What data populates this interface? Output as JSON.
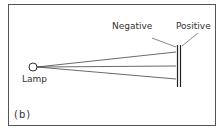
{
  "figure": {
    "panel_label": "(b)",
    "labels": {
      "lamp": "Lamp",
      "negative": "Negative",
      "positive": "Positive"
    },
    "colors": {
      "line": "#333333",
      "frame": "#555555",
      "background": "#ffffff"
    }
  }
}
